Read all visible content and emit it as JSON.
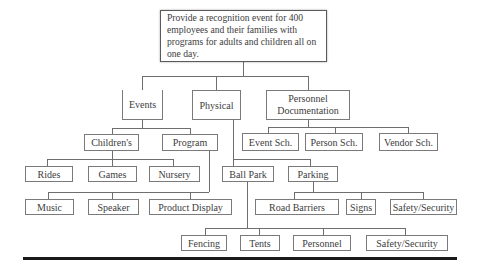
{
  "diagram": {
    "type": "work-breakdown-structure",
    "root": {
      "label": "Provide a recognition event for 400 employees and their families with programs for adults and children all on one day."
    },
    "level1": {
      "events": "Events",
      "physical": "Physical",
      "personnel_documentation": "Personnel Documentation"
    },
    "events_children": {
      "childrens": "Children's",
      "program": "Program"
    },
    "childrens_children": {
      "rides": "Rides",
      "games": "Games",
      "nursery": "Nursery"
    },
    "program_children": {
      "music": "Music",
      "speaker": "Speaker",
      "product_display": "Product Display"
    },
    "physical_children": {
      "ball_park": "Ball Park",
      "parking": "Parking"
    },
    "parking_children": {
      "road_barriers": "Road Barriers",
      "signs": "Signs",
      "safety_security": "Safety/Security"
    },
    "ball_park_children": {
      "fencing": "Fencing",
      "tents": "Tents",
      "personnel": "Personnel",
      "safety_security": "Safety/Security"
    },
    "personnel_documentation_children": {
      "event_sch": "Event Sch.",
      "person_sch": "Person Sch.",
      "vendor_sch": "Vendor Sch."
    },
    "colors": {
      "line": "#6e6e6e",
      "box_border": "#7a7a7a",
      "text": "#3d3d3d",
      "rule": "#1a1a1a"
    }
  }
}
